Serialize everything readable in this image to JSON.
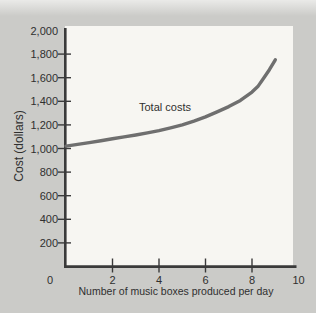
{
  "figure": {
    "colors": {
      "background": "#cbcbc8",
      "background_top_edge": "#eaeae8",
      "plot_area": "#f7f6f2",
      "axis": "#3a3a3a",
      "curve": "#6f6f6f",
      "text": "#2f2f2f"
    }
  },
  "chart_data": {
    "type": "line",
    "title": "",
    "xlabel": "Number of music boxes produced per day",
    "ylabel": "Cost (dollars)",
    "xlim": [
      0,
      10
    ],
    "ylim": [
      0,
      2000
    ],
    "grid": false,
    "legend": "inline-annotation",
    "x_tick_values": [
      0,
      2,
      4,
      6,
      8,
      10
    ],
    "x_tick_labels": [
      "0",
      "2",
      "4",
      "6",
      "8",
      "10"
    ],
    "x_ticks_with_marks": [
      2,
      4,
      6,
      8
    ],
    "y_tick_values": [
      200,
      400,
      600,
      800,
      1000,
      1200,
      1400,
      1600,
      1800,
      2000
    ],
    "y_tick_labels": [
      "200",
      "400",
      "600",
      "800",
      "1,000",
      "1,200",
      "1,400",
      "1,600",
      "1,800",
      "2,000"
    ],
    "y_ticks_with_marks": [
      200,
      400,
      600,
      800,
      1000,
      1200,
      1400,
      1600,
      1800
    ],
    "series": [
      {
        "name": "Total costs",
        "points": [
          [
            0,
            1020
          ],
          [
            0.5,
            1035
          ],
          [
            1,
            1050
          ],
          [
            1.5,
            1065
          ],
          [
            2,
            1082
          ],
          [
            2.5,
            1098
          ],
          [
            3,
            1114
          ],
          [
            3.5,
            1132
          ],
          [
            4,
            1152
          ],
          [
            4.5,
            1175
          ],
          [
            5,
            1200
          ],
          [
            5.5,
            1232
          ],
          [
            6,
            1268
          ],
          [
            6.5,
            1310
          ],
          [
            7,
            1355
          ],
          [
            7.5,
            1408
          ],
          [
            8,
            1478
          ],
          [
            8.25,
            1525
          ],
          [
            8.5,
            1595
          ],
          [
            8.75,
            1668
          ],
          [
            9,
            1752
          ]
        ]
      }
    ]
  }
}
